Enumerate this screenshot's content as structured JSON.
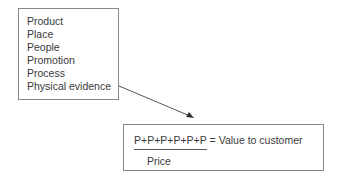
{
  "diagram": {
    "elements_box": {
      "items": [
        "Product",
        "Place",
        "People",
        "Promotion",
        "Process",
        "Physical evidence"
      ]
    },
    "formula_box": {
      "numerator": "P+P+P+P+P+P",
      "equals_text": " = Value to customer",
      "denominator": "Price"
    },
    "arrow": {
      "from": "elements_box",
      "to": "formula_box"
    },
    "colors": {
      "border": "#888888",
      "text": "#3a3a3a",
      "line": "#555555"
    }
  }
}
